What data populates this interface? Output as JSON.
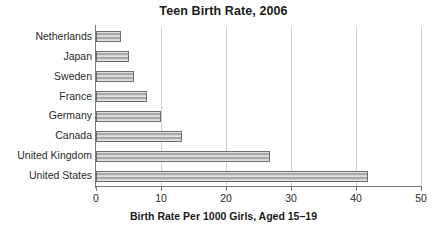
{
  "chart_data": {
    "type": "bar",
    "orientation": "horizontal",
    "title": "Teen Birth Rate, 2006",
    "xlabel": "Birth Rate Per 1000 Girls, Aged 15–19",
    "ylabel": "",
    "categories": [
      "Netherlands",
      "Japan",
      "Sweden",
      "France",
      "Germany",
      "Canada",
      "United Kingdom",
      "United States"
    ],
    "values": [
      3.8,
      5.1,
      5.9,
      7.8,
      10.0,
      13.3,
      26.7,
      41.9
    ],
    "xlim": [
      0,
      50
    ],
    "xticks": [
      0,
      10,
      20,
      30,
      40,
      50
    ],
    "xtick_labels": [
      "0",
      "10",
      "20",
      "30",
      "40",
      "50"
    ],
    "grid": "vertical",
    "legend": "none",
    "bar_fill": "#b8b8b8",
    "bar_edge": "#6e6e6e",
    "axis_color": "#7a7a7a",
    "grid_color": "#cfcfcf",
    "text_color": "#231f20",
    "background": "#ffffff"
  }
}
